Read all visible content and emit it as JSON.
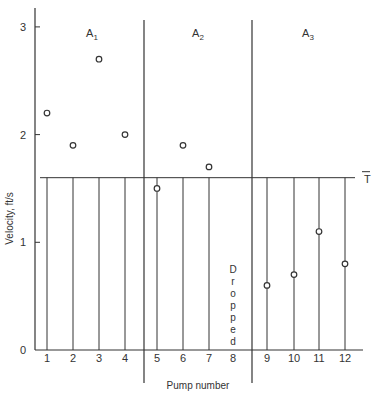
{
  "chart_data": {
    "type": "scatter",
    "title": "",
    "xlabel": "Pump number",
    "ylabel": "Velocity, ft/s",
    "ylim": [
      0,
      3
    ],
    "yticks": [
      0,
      1,
      2,
      3
    ],
    "categories": [
      "1",
      "2",
      "3",
      "4",
      "5",
      "6",
      "7",
      "8",
      "9",
      "10",
      "11",
      "12"
    ],
    "series": [
      {
        "name": "Velocity",
        "x": [
          1,
          2,
          3,
          4,
          5,
          6,
          7,
          9,
          10,
          11,
          12
        ],
        "values": [
          2.2,
          1.9,
          2.7,
          2.0,
          1.5,
          1.9,
          1.7,
          0.6,
          0.7,
          1.1,
          0.8
        ]
      }
    ],
    "reference_line": {
      "label": "T̄",
      "value": 1.6
    },
    "regions": [
      {
        "label": "A",
        "sub": "1",
        "pumps": [
          1,
          2,
          3,
          4
        ]
      },
      {
        "label": "A",
        "sub": "2",
        "pumps": [
          5,
          6,
          7,
          8
        ]
      },
      {
        "label": "A",
        "sub": "3",
        "pumps": [
          9,
          10,
          11,
          12
        ]
      }
    ],
    "annotations": [
      {
        "pump": 8,
        "text": "Dropped"
      }
    ],
    "grid": false,
    "legend": "none"
  },
  "labels": {
    "ylabel": "Velocity, ft/s",
    "xlabel": "Pump number",
    "tbar": "T",
    "dropped": "Dropped"
  }
}
